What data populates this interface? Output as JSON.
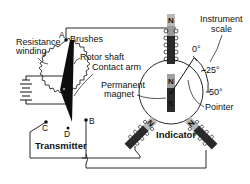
{
  "diagram": {
    "type": "synchro-system-schematic",
    "transmitter": {
      "title": "Transmitter",
      "labels": {
        "resistance_winding": [
          "Resistance",
          "winding"
        ],
        "brushes": "Brushes",
        "rotor_shaft": "Rotor shaft",
        "contact_arm": "Contact arm"
      },
      "terminals": [
        "A",
        "B",
        "C",
        "D"
      ]
    },
    "indicator": {
      "title": "Indicator",
      "labels": {
        "permanent_magnet": [
          "Permanent",
          "magnet"
        ],
        "pointer": "Pointer",
        "instrument_scale": [
          "Instrument",
          "scale"
        ]
      },
      "scale_marks": [
        "0°",
        "25°",
        "50°"
      ],
      "pole_labels": {
        "top_coil": "N",
        "magnet_north": "N",
        "magnet_south": "S",
        "left_coil": "N",
        "right_coil": "N"
      }
    },
    "colors": {
      "line": "#111111",
      "coil_light": "#b8b8b8",
      "coil_dark": "#2a2a2a",
      "background": "#ffffff"
    }
  }
}
